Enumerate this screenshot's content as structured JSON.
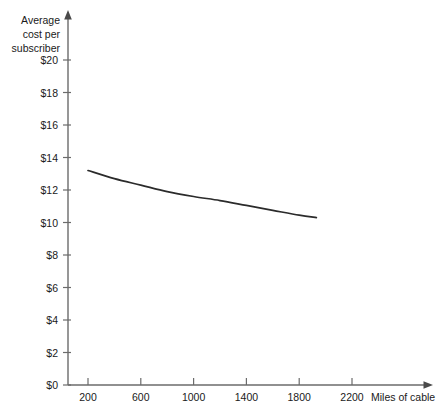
{
  "chart_data": {
    "type": "line",
    "title": "",
    "xlabel": "Miles of cable",
    "ylabel": "Average cost per subscriber",
    "ylabel_lines": [
      "Average",
      "cost per",
      "subscriber"
    ],
    "xlim": [
      0,
      2400
    ],
    "ylim": [
      0,
      20
    ],
    "x_ticks": [
      200,
      600,
      1000,
      1400,
      1800,
      2200
    ],
    "x_tick_labels": [
      "200",
      "600",
      "1000",
      "1400",
      "1800",
      "2200"
    ],
    "y_ticks": [
      0,
      2,
      4,
      6,
      8,
      10,
      12,
      14,
      16,
      18,
      20
    ],
    "y_tick_labels": [
      "$0",
      "$2",
      "$4",
      "$6",
      "$8",
      "$10",
      "$12",
      "$14",
      "$16",
      "$18",
      "$20"
    ],
    "grid": false,
    "legend": false,
    "series": [
      {
        "name": "Average cost per subscriber",
        "color": "#2b2b2b",
        "x": [
          200,
          400,
          600,
          800,
          1000,
          1200,
          1400,
          1600,
          1800,
          1930
        ],
        "values": [
          13.2,
          12.7,
          12.3,
          11.9,
          11.6,
          11.35,
          11.05,
          10.75,
          10.45,
          10.3
        ]
      }
    ]
  }
}
